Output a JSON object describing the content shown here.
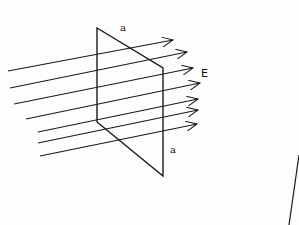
{
  "diagram": {
    "labels": {
      "side_top": "a",
      "side_right": "a",
      "field": "E"
    },
    "plane": {
      "corners": [
        [
          97,
          28
        ],
        [
          163,
          68
        ],
        [
          163,
          176
        ],
        [
          97,
          122
        ]
      ]
    },
    "field_lines": [
      {
        "x1": 8,
        "y1": 71,
        "x2": 173,
        "y2": 40
      },
      {
        "x1": 10,
        "y1": 88,
        "x2": 187,
        "y2": 52
      },
      {
        "x1": 14,
        "y1": 104,
        "x2": 193,
        "y2": 68
      },
      {
        "x1": 26,
        "y1": 119,
        "x2": 200,
        "y2": 83
      },
      {
        "x1": 38,
        "y1": 132,
        "x2": 198,
        "y2": 99
      },
      {
        "x1": 38,
        "y1": 143,
        "x2": 198,
        "y2": 110
      },
      {
        "x1": 40,
        "y1": 156,
        "x2": 197,
        "y2": 124
      }
    ],
    "stray_line": {
      "x1": 299,
      "y1": 155,
      "x2": 289,
      "y2": 225
    },
    "colors": {
      "stroke": "#1a1a1a",
      "background": "#fdfdfd"
    }
  }
}
